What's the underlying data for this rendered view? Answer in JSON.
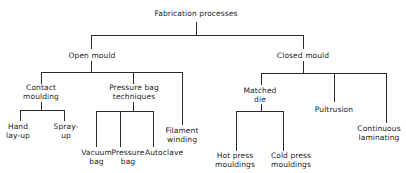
{
  "diagram": {
    "title": "Fabrication processes",
    "open_mould": {
      "label": "Open mould",
      "contact_moulding": {
        "line1": "Contact",
        "line2": "moulding",
        "hand_layup": {
          "line1": "Hand",
          "line2": "lay-up"
        },
        "spray_up": {
          "line1": "Spray-",
          "line2": "up"
        }
      },
      "pressure_bag_techniques": {
        "line1": "Pressure bag",
        "line2": "techniques",
        "vacuum_bag": {
          "line1": "Vacuum",
          "line2": "bag"
        },
        "pressure_bag": {
          "line1": "Pressure",
          "line2": "bag"
        },
        "autoclave": {
          "line1": "Autoclave"
        }
      },
      "filament_winding": {
        "line1": "Filament",
        "line2": "winding"
      }
    },
    "closed_mould": {
      "label": "Closed mould",
      "matched_die": {
        "line1": "Matched",
        "line2": "die",
        "hot_press": {
          "line1": "Hot press",
          "line2": "mouldings"
        },
        "cold_press": {
          "line1": "Cold press",
          "line2": "mouldings"
        }
      },
      "pultrusion": {
        "line1": "Pultrusion"
      },
      "continuous_laminating": {
        "line1": "Continuous",
        "line2": "laminating"
      }
    }
  }
}
